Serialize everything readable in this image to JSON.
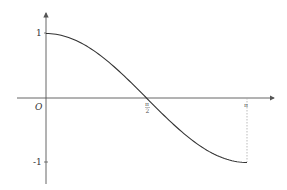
{
  "chart_data": {
    "type": "line",
    "title": "",
    "xlabel": "",
    "ylabel": "",
    "function": "cos(x)",
    "x": [
      0,
      0.3927,
      0.7854,
      1.1781,
      1.5708,
      1.9635,
      2.3562,
      2.7489,
      3.1416
    ],
    "values": [
      1,
      0.9239,
      0.7071,
      0.3827,
      0,
      -0.3827,
      -0.7071,
      -0.9239,
      -1
    ],
    "xlim": [
      0,
      3.1416
    ],
    "ylim": [
      -1,
      1
    ],
    "x_tick_labels": [
      "π/2",
      "π"
    ],
    "y_tick_labels": [
      "1",
      "-1"
    ],
    "origin_label": "O",
    "annotations": [
      "dotted vertical line from (π, 0) to (π, -1)"
    ],
    "grid": false,
    "legend": null
  },
  "labels": {
    "origin": "O",
    "y_one": "1",
    "y_neg_one": "-1",
    "x_half_pi_num": "π",
    "x_half_pi_den": "2",
    "x_pi": "π"
  },
  "colors": {
    "curve": "#333333",
    "axis": "#555555",
    "dotted": "#aaaaaa"
  }
}
